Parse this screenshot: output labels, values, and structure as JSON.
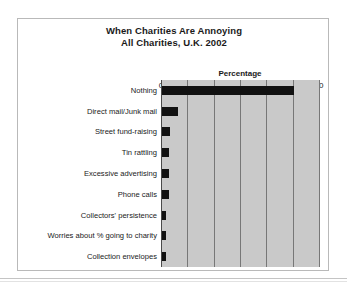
{
  "chart_data": {
    "type": "bar",
    "orientation": "horizontal",
    "title": "When Charities Are Annoying",
    "subtitle": "All Charities, U.K. 2002",
    "xlabel": "Percentage",
    "ylabel": "",
    "xlim": [
      0,
      60
    ],
    "xticks": [
      0,
      10,
      20,
      30,
      40,
      50,
      60
    ],
    "xtick_labels": [
      "0",
      "10",
      "20",
      "30",
      "40",
      "50",
      "60"
    ],
    "grid": "vertical",
    "legend": "none",
    "bar_color": "#111111",
    "plot_background": "#c9c9c9",
    "gridline_color": "#777777",
    "categories": [
      "Nothing",
      "Direct mail/Junk mail",
      "Street fund-raising",
      "Tin rattling",
      "Excessive advertising",
      "Phone calls",
      "Collectors' persistence",
      "Worries about % going to charity",
      "Collection envelopes"
    ],
    "values": [
      50,
      6,
      3,
      2.5,
      2.5,
      2.5,
      1.5,
      1.5,
      1.5
    ]
  }
}
